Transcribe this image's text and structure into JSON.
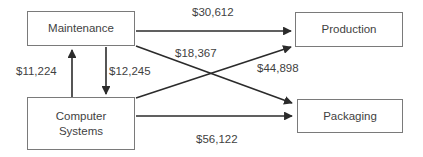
{
  "diagram": {
    "type": "flow-network",
    "nodes": [
      {
        "id": "maintenance",
        "label": "Maintenance"
      },
      {
        "id": "production",
        "label": "Production"
      },
      {
        "id": "computer_systems",
        "label_line1": "Computer",
        "label_line2": "Systems"
      },
      {
        "id": "packaging",
        "label": "Packaging"
      }
    ],
    "edges": [
      {
        "id": "maint_prod",
        "from": "Maintenance",
        "to": "Production",
        "label": "$30,612"
      },
      {
        "id": "maint_pack",
        "from": "Maintenance",
        "to": "Packaging",
        "label": "$18,367"
      },
      {
        "id": "cs_maint",
        "from": "Computer Systems",
        "to": "Maintenance",
        "label": "$11,224"
      },
      {
        "id": "maint_cs",
        "from": "Maintenance",
        "to": "Computer Systems",
        "label": "$12,245"
      },
      {
        "id": "cs_prod",
        "from": "Computer Systems",
        "to": "Production",
        "label": "$44,898"
      },
      {
        "id": "cs_pack",
        "from": "Computer Systems",
        "to": "Packaging",
        "label": "$56,122"
      }
    ],
    "colors": {
      "stroke": "#2b2b2b",
      "node_border": "#7a7a7a",
      "text": "#3f3f3f",
      "background": "#ffffff"
    }
  }
}
